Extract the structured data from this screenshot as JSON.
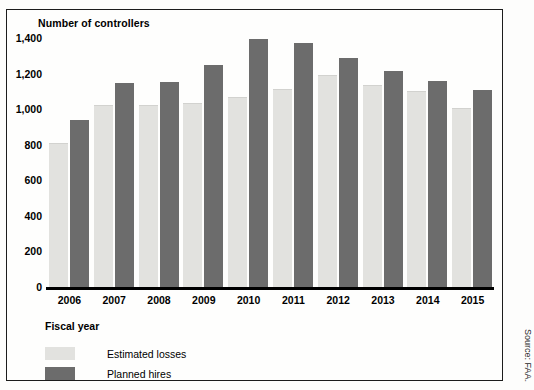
{
  "figure": {
    "title": "Number of controllers",
    "source_note": "Source: FAA."
  },
  "legend": {
    "items": [
      {
        "label": "Estimated losses",
        "color": "#e2e2df",
        "key": "losses"
      },
      {
        "label": "Planned hires",
        "color": "#6c6c6c",
        "key": "hires"
      }
    ]
  },
  "axes": {
    "x_title": "Fiscal year",
    "y_ticks": [
      "1,400",
      "1,200",
      "1,000",
      "800",
      "600",
      "400",
      "200",
      "0"
    ]
  },
  "chart_data": {
    "type": "bar",
    "title": "Number of controllers",
    "xlabel": "Fiscal year",
    "ylabel": "Number of controllers",
    "ylim": [
      0,
      1400
    ],
    "yticks": [
      0,
      200,
      400,
      600,
      800,
      1000,
      1200,
      1400
    ],
    "grid": false,
    "legend_position": "below-axis-left",
    "categories": [
      "2006",
      "2007",
      "2008",
      "2009",
      "2010",
      "2011",
      "2012",
      "2013",
      "2014",
      "2015"
    ],
    "series": [
      {
        "name": "Estimated losses",
        "color": "#e2e2df",
        "values": [
          805,
          1020,
          1015,
          1030,
          1065,
          1110,
          1185,
          1130,
          1095,
          1000
        ]
      },
      {
        "name": "Planned hires",
        "color": "#6c6c6c",
        "values": [
          940,
          1145,
          1155,
          1250,
          1395,
          1370,
          1285,
          1215,
          1160,
          1105
        ]
      }
    ],
    "source": "FAA."
  }
}
